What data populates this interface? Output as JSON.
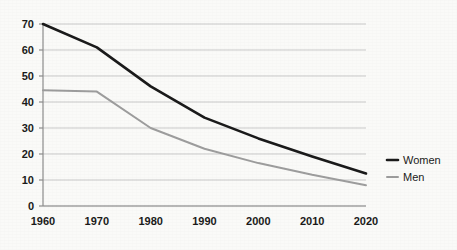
{
  "chart_data": {
    "type": "line",
    "title": "",
    "subtitle": "",
    "xlabel": "",
    "ylabel": "",
    "categories": [
      "1960",
      "1970",
      "1980",
      "1990",
      "2000",
      "2010",
      "2020"
    ],
    "x": [
      1960,
      1970,
      1980,
      1990,
      2000,
      2010,
      2020
    ],
    "xlim": [
      1960,
      2020
    ],
    "ylim": [
      0,
      70
    ],
    "yticks": [
      0,
      10,
      20,
      30,
      40,
      50,
      60,
      70
    ],
    "ytick_labels": [
      "0",
      "10",
      "20",
      "30",
      "40",
      "50",
      "60",
      "70"
    ],
    "xtick_labels": [
      "1960",
      "1970",
      "1980",
      "1990",
      "2000",
      "2010",
      "2020"
    ],
    "grid": "horizontal",
    "legend_position": "right",
    "series": [
      {
        "name": "Women",
        "color": "#1a1a1a",
        "line_width": 2.6,
        "values": [
          70,
          61,
          46,
          34,
          26,
          19,
          12.5
        ]
      },
      {
        "name": "Men",
        "color": "#9d9d9d",
        "line_width": 2.0,
        "values": [
          44.5,
          44,
          30,
          22,
          16.5,
          12,
          8
        ]
      }
    ]
  },
  "legend": {
    "items": [
      {
        "label": "Women",
        "color": "#1a1a1a"
      },
      {
        "label": "Men",
        "color": "#9d9d9d"
      }
    ]
  },
  "axes": {
    "axis_line_color": "#8c8c8c",
    "grid_line_color": "#c9c9c9"
  },
  "colors": {
    "background": "#fafaf8",
    "text": "#1a1a1a",
    "women_line": "#1a1a1a",
    "men_line": "#9d9d9d"
  }
}
